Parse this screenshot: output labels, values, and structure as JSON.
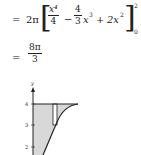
{
  "equation": {
    "line1": {
      "equals": "=",
      "prefix": "2π",
      "term1_num": "x⁴",
      "term1_den": "4",
      "minus": "−",
      "term2_num": "4",
      "term2_den": "3",
      "term2_var": "x",
      "term2_exp": "3",
      "plus": "+",
      "term3": "2x",
      "term3_exp": "2",
      "upper_limit": "2",
      "lower_limit": "0"
    },
    "line2": {
      "equals": "=",
      "result_num": "8π",
      "result_den": "3"
    }
  },
  "graph": {
    "y_axis_label": "y",
    "y_ticks": [
      "4",
      "3",
      "2"
    ],
    "fill_color": "#d8d8d8",
    "line_color": "#222222"
  }
}
